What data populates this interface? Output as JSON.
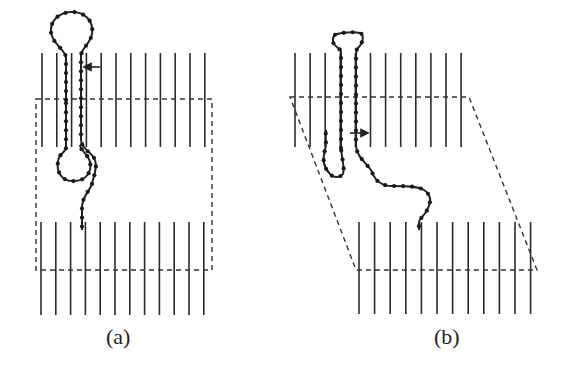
{
  "figure": {
    "panels": [
      {
        "id": "a",
        "label": "(a)",
        "label_pos": [
          120,
          337
        ],
        "description": "Rectangular box, undeformed",
        "top_lines": {
          "x_start": 42,
          "count": 12,
          "spacing": 14.8,
          "y1": 53,
          "y2": 147
        },
        "bottom_lines": {
          "x_start": 41,
          "count": 12,
          "spacing": 14.8,
          "y1": 222,
          "y2": 315
        },
        "dashed_box": [
          [
            36,
            99
          ],
          [
            212,
            99
          ],
          [
            212,
            270
          ],
          [
            36,
            270
          ]
        ],
        "arrow": {
          "x1": 100,
          "y1": 67,
          "x2": 88,
          "y2": 67,
          "direction": "left"
        }
      },
      {
        "id": "b",
        "label": "(b)",
        "label_pos": [
          449,
          337
        ],
        "description": "Sheared parallelogram box",
        "top_lines": {
          "x_start": 295,
          "count": 12,
          "spacing": 15.1,
          "y1": 53,
          "y2": 147
        },
        "bottom_lines": {
          "x_start": 359,
          "count": 12,
          "spacing": 15.6,
          "y1": 222,
          "y2": 314
        },
        "dashed_box": [
          [
            290,
            97
          ],
          [
            469,
            97
          ],
          [
            537,
            270
          ],
          [
            356,
            270
          ]
        ],
        "arrow": {
          "x1": 350,
          "y1": 133,
          "x2": 366,
          "y2": 133,
          "direction": "right"
        }
      }
    ],
    "colors": {
      "line": "#2a2a2a",
      "dashed": "#333333",
      "chain": "#222222",
      "bead": "#1a1a1a"
    }
  }
}
